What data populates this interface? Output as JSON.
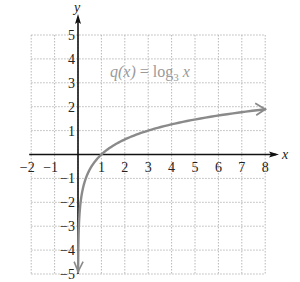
{
  "chart_data": {
    "type": "line",
    "title": "",
    "function_label": "q(x) = log3 x",
    "function_label_parts": {
      "lhs": "q(x) = log",
      "base": "3",
      "arg": "x"
    },
    "xlabel": "x",
    "ylabel": "y",
    "xlim": [
      -2,
      8
    ],
    "ylim": [
      -5,
      5
    ],
    "grid": true,
    "x_ticks": [
      -2,
      -1,
      1,
      2,
      3,
      4,
      5,
      6,
      7,
      8
    ],
    "y_ticks": [
      -5,
      -4,
      -3,
      -2,
      -1,
      1,
      2,
      3,
      4,
      5
    ],
    "x_tick_labels": [
      "−2",
      "−1",
      "1",
      "2",
      "3",
      "4",
      "5",
      "6",
      "7",
      "8"
    ],
    "y_tick_labels": [
      "−5",
      "−4",
      "−3",
      "−2",
      "−1",
      "1",
      "2",
      "3",
      "4",
      "5"
    ],
    "series": [
      {
        "name": "q(x) = log3 x",
        "x": [
          0.0045,
          0.01,
          0.03,
          0.1,
          0.333,
          0.5,
          1,
          2,
          3,
          4,
          5,
          6,
          7,
          8
        ],
        "y": [
          -4.9,
          -4.19,
          -3.19,
          -2.1,
          -1.0,
          -0.63,
          0,
          0.63,
          1,
          1.26,
          1.46,
          1.63,
          1.77,
          1.89
        ],
        "color": "#8a8a8a",
        "arrows": "both"
      }
    ],
    "colors": {
      "axes": "#111111",
      "grid": "#b8b8b8",
      "curve": "#8a8a8a",
      "label": "#9a9a9a"
    }
  }
}
